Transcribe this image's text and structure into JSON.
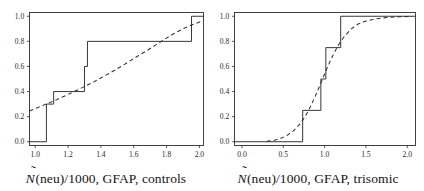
{
  "figure": {
    "type": "two-panel-ecdf",
    "width": 424,
    "height": 191
  },
  "panels": [
    {
      "id": "controls",
      "caption_prefix": "N",
      "caption_hat": "̃",
      "caption_rest": "(neu)/1000, GFAP, controls",
      "caption_full": "Ñ(neu)/1000, GFAP, controls"
    },
    {
      "id": "trisomic",
      "caption_prefix": "N",
      "caption_hat": "̃",
      "caption_rest": "(neu)/1000, GFAP, trisomic",
      "caption_full": "Ñ(neu)/1000, GFAP, trisomic"
    }
  ],
  "chart_data": [
    {
      "type": "line",
      "id": "controls",
      "title": "",
      "xlabel": "Ñ(neu)/1000, GFAP, controls",
      "ylabel": "",
      "xlim": [
        0.965,
        2.025
      ],
      "ylim": [
        -0.03,
        1.03
      ],
      "xticks": [
        1.0,
        1.2,
        1.4,
        1.6,
        1.8,
        2.0
      ],
      "xticklabels": [
        "1.0",
        "1.2",
        "1.4",
        "1.6",
        "1.8",
        "2.0"
      ],
      "yticks": [
        0.0,
        0.2,
        0.4,
        0.6,
        0.8,
        1.0
      ],
      "yticklabels": [
        "0.0",
        "0.2",
        "0.4",
        "0.6",
        "0.8",
        "1.0"
      ],
      "grid": false,
      "legend": "none",
      "series": [
        {
          "name": "empirical CDF (step)",
          "style": "step",
          "linestyle": "solid",
          "x": [
            0.965,
            1.068,
            1.068,
            1.112,
            1.112,
            1.3,
            1.3,
            1.318,
            1.318,
            1.952,
            1.952,
            2.025
          ],
          "y": [
            0.0,
            0.0,
            0.3,
            0.3,
            0.4,
            0.4,
            0.6,
            0.6,
            0.8,
            0.8,
            1.0,
            1.0
          ]
        },
        {
          "name": "fitted CDF",
          "style": "curve",
          "linestyle": "dashed",
          "x": [
            0.965,
            1.02,
            1.075,
            1.13,
            1.185,
            1.24,
            1.295,
            1.35,
            1.405,
            1.46,
            1.515,
            1.57,
            1.625,
            1.68,
            1.735,
            1.79,
            1.845,
            1.9,
            1.955,
            2.01,
            2.025
          ],
          "y": [
            0.245,
            0.275,
            0.305,
            0.335,
            0.368,
            0.402,
            0.437,
            0.473,
            0.512,
            0.552,
            0.594,
            0.638,
            0.683,
            0.726,
            0.772,
            0.818,
            0.862,
            0.9,
            0.932,
            0.958,
            0.964
          ]
        }
      ]
    },
    {
      "type": "line",
      "id": "trisomic",
      "title": "",
      "xlabel": "Ñ(neu)/1000, GFAP, trisomic",
      "ylabel": "",
      "xlim": [
        -0.09,
        2.1
      ],
      "ylim": [
        -0.03,
        1.03
      ],
      "xticks": [
        0.0,
        0.5,
        1.0,
        1.5,
        2.0
      ],
      "xticklabels": [
        "0.0",
        "0.5",
        "1.0",
        "1.5",
        "2.0"
      ],
      "yticks": [
        0.0,
        0.2,
        0.4,
        0.6,
        0.8,
        1.0
      ],
      "yticklabels": [
        "0.0",
        "0.2",
        "0.4",
        "0.6",
        "0.8",
        "1.0"
      ],
      "grid": false,
      "legend": "none",
      "series": [
        {
          "name": "empirical CDF (step)",
          "style": "step",
          "linestyle": "solid",
          "x": [
            -0.09,
            0.735,
            0.735,
            0.955,
            0.955,
            1.015,
            1.015,
            1.195,
            1.195,
            2.1
          ],
          "y": [
            0.0,
            0.0,
            0.25,
            0.25,
            0.5,
            0.5,
            0.75,
            0.75,
            1.0,
            1.0
          ]
        },
        {
          "name": "fitted CDF",
          "style": "curve",
          "linestyle": "dashed",
          "x": [
            0.3,
            0.38,
            0.46,
            0.54,
            0.62,
            0.7,
            0.76,
            0.82,
            0.88,
            0.94,
            1.0,
            1.06,
            1.12,
            1.18,
            1.24,
            1.32,
            1.4,
            1.48,
            1.6,
            1.75,
            1.9,
            2.06
          ],
          "y": [
            0.003,
            0.01,
            0.024,
            0.048,
            0.085,
            0.14,
            0.196,
            0.268,
            0.352,
            0.444,
            0.54,
            0.632,
            0.714,
            0.784,
            0.84,
            0.898,
            0.936,
            0.958,
            0.978,
            0.99,
            0.996,
            0.999
          ]
        }
      ]
    }
  ]
}
